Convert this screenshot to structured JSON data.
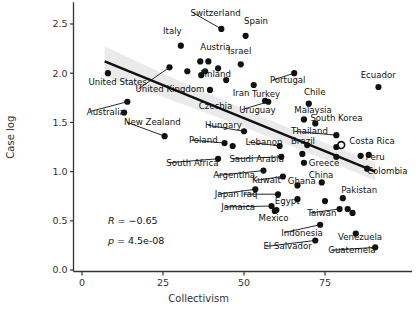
{
  "chart_data": {
    "type": "scatter",
    "title": "",
    "xlabel": "Collectivism",
    "ylabel": "Case log",
    "xlim": [
      -3,
      100
    ],
    "ylim": [
      -0.07,
      2.72
    ],
    "xticks": [
      0,
      25,
      50,
      75
    ],
    "xtick_labels": [
      "0",
      "25",
      "50",
      "75"
    ],
    "yticks": [
      0.0,
      0.5,
      1.0,
      1.5,
      2.0,
      2.5
    ],
    "ytick_labels": [
      "0.0",
      "0.5",
      "1.0",
      "1.5",
      "2.0",
      "2.5"
    ],
    "grid": false,
    "legend": null,
    "marker_color": "#111111",
    "line_color": "#111111",
    "band_color": "#d9d9d9",
    "annotations": [
      {
        "name": "correlation",
        "prefix": "R",
        "text": "R = −0.65",
        "value": -0.65,
        "x": 8,
        "y": 0.47
      },
      {
        "name": "pvalue",
        "prefix": "p",
        "text": "p = 4.5e-08",
        "value": 4.5e-08,
        "x": 8,
        "y": 0.26
      }
    ],
    "fit_line": {
      "x_start": 7.0,
      "x_end": 90.5,
      "y_start": 2.12,
      "y_end": 1.0
    },
    "points": [
      {
        "label": "United States",
        "x": 8.0,
        "y": 2.0,
        "filled": true,
        "label_x": 2.0,
        "label_y": 1.88,
        "anchor": "start"
      },
      {
        "label": "Australia",
        "x": 14.0,
        "y": 1.71,
        "filled": true,
        "label_x": 1.5,
        "label_y": 1.58,
        "anchor": "start"
      },
      {
        "label": "",
        "x": 13.0,
        "y": 1.6,
        "filled": true,
        "label_x": 0,
        "label_y": 0,
        "anchor": "start"
      },
      {
        "label": "New Zealand",
        "x": 25.5,
        "y": 1.36,
        "filled": true,
        "label_x": 13.0,
        "label_y": 1.47,
        "anchor": "start"
      },
      {
        "label": "United Kingdom",
        "x": 27.0,
        "y": 2.06,
        "filled": true,
        "label_x": 16.5,
        "label_y": 1.81,
        "anchor": "start"
      },
      {
        "label": "Italy",
        "x": 30.5,
        "y": 2.28,
        "filled": true,
        "label_x": 25.0,
        "label_y": 2.4,
        "anchor": "start"
      },
      {
        "label": "",
        "x": 32.5,
        "y": 2.02,
        "filled": true,
        "label_x": 0,
        "label_y": 0,
        "anchor": "start"
      },
      {
        "label": "Switzerland",
        "x": 43.0,
        "y": 2.45,
        "filled": true,
        "label_x": 33.5,
        "label_y": 2.58,
        "anchor": "start"
      },
      {
        "label": "Austria",
        "x": 36.5,
        "y": 2.12,
        "filled": true,
        "label_x": 36.5,
        "label_y": 2.24,
        "anchor": "start"
      },
      {
        "label": "",
        "x": 39.0,
        "y": 2.12,
        "filled": true,
        "label_x": 0,
        "label_y": 0,
        "anchor": "start"
      },
      {
        "label": "",
        "x": 38.0,
        "y": 2.02,
        "filled": true,
        "label_x": 0,
        "label_y": 0,
        "anchor": "start"
      },
      {
        "label": "Finland",
        "x": 42.0,
        "y": 2.05,
        "filled": true,
        "label_x": 36.5,
        "label_y": 1.96,
        "anchor": "start"
      },
      {
        "label": "",
        "x": 36.8,
        "y": 1.98,
        "filled": true,
        "label_x": 0,
        "label_y": 0,
        "anchor": "start"
      },
      {
        "label": "",
        "x": 44.5,
        "y": 1.93,
        "filled": true,
        "label_x": 0,
        "label_y": 0,
        "anchor": "start"
      },
      {
        "label": "Czechia",
        "x": 39.5,
        "y": 1.83,
        "filled": true,
        "label_x": 36.0,
        "label_y": 1.64,
        "anchor": "start"
      },
      {
        "label": "Spain",
        "x": 50.5,
        "y": 2.38,
        "filled": true,
        "label_x": 50.0,
        "label_y": 2.5,
        "anchor": "start"
      },
      {
        "label": "Israel",
        "x": 49.0,
        "y": 2.09,
        "filled": true,
        "label_x": 45.0,
        "label_y": 2.2,
        "anchor": "start"
      },
      {
        "label": "Iran",
        "x": 53.0,
        "y": 1.88,
        "filled": true,
        "label_x": 46.5,
        "label_y": 1.77,
        "anchor": "start"
      },
      {
        "label": "Turkey",
        "x": 56.5,
        "y": 1.72,
        "filled": true,
        "label_x": 52.5,
        "label_y": 1.76,
        "anchor": "start"
      },
      {
        "label": "Uruguay",
        "x": 57.5,
        "y": 1.71,
        "filled": true,
        "label_x": 48.5,
        "label_y": 1.6,
        "anchor": "start"
      },
      {
        "label": "Portugal",
        "x": 65.5,
        "y": 2.0,
        "filled": true,
        "label_x": 58.0,
        "label_y": 1.9,
        "anchor": "start"
      },
      {
        "label": "Ecuador",
        "x": 91.5,
        "y": 1.86,
        "filled": true,
        "label_x": 86.0,
        "label_y": 1.95,
        "anchor": "start"
      },
      {
        "label": "Chile",
        "x": 70.0,
        "y": 1.69,
        "filled": true,
        "label_x": 68.5,
        "label_y": 1.78,
        "anchor": "start"
      },
      {
        "label": "Malaysia",
        "x": 68.5,
        "y": 1.53,
        "filled": true,
        "label_x": 65.5,
        "label_y": 1.6,
        "anchor": "start"
      },
      {
        "label": "South Korea",
        "x": 72.0,
        "y": 1.49,
        "filled": true,
        "label_x": 70.5,
        "label_y": 1.51,
        "anchor": "start"
      },
      {
        "label": "Thailand",
        "x": 78.5,
        "y": 1.37,
        "filled": true,
        "label_x": 64.5,
        "label_y": 1.38,
        "anchor": "start"
      },
      {
        "label": "Costa Rica",
        "x": 80.0,
        "y": 1.27,
        "filled": false,
        "label_x": 82.5,
        "label_y": 1.28,
        "anchor": "start"
      },
      {
        "label": "",
        "x": 78.5,
        "y": 1.25,
        "filled": true,
        "label_x": 0,
        "label_y": 0,
        "anchor": "start"
      },
      {
        "label": "",
        "x": 78.5,
        "y": 1.15,
        "filled": true,
        "label_x": 0,
        "label_y": 0,
        "anchor": "start"
      },
      {
        "label": "Peru",
        "x": 86.0,
        "y": 1.16,
        "filled": true,
        "label_x": 87.5,
        "label_y": 1.12,
        "anchor": "start"
      },
      {
        "label": "",
        "x": 88.5,
        "y": 1.17,
        "filled": true,
        "label_x": 0,
        "label_y": 0,
        "anchor": "start"
      },
      {
        "label": "Colombia",
        "x": 88.0,
        "y": 1.03,
        "filled": true,
        "label_x": 88.0,
        "label_y": 0.98,
        "anchor": "start"
      },
      {
        "label": "Brazil",
        "x": 69.5,
        "y": 1.27,
        "filled": true,
        "label_x": 64.5,
        "label_y": 1.28,
        "anchor": "start"
      },
      {
        "label": "",
        "x": 68.0,
        "y": 1.18,
        "filled": true,
        "label_x": 0,
        "label_y": 0,
        "anchor": "start"
      },
      {
        "label": "Greece",
        "x": 68.5,
        "y": 1.09,
        "filled": true,
        "label_x": 70.0,
        "label_y": 1.06,
        "anchor": "start"
      },
      {
        "label": "Lebanon",
        "x": 61.0,
        "y": 1.26,
        "filled": true,
        "label_x": 50.5,
        "label_y": 1.27,
        "anchor": "start"
      },
      {
        "label": "",
        "x": 46.5,
        "y": 1.26,
        "filled": true,
        "label_x": 0,
        "label_y": 0,
        "anchor": "start"
      },
      {
        "label": "Hungary",
        "x": 50.0,
        "y": 1.41,
        "filled": true,
        "label_x": 38.0,
        "label_y": 1.44,
        "anchor": "start"
      },
      {
        "label": "Poland",
        "x": 44.0,
        "y": 1.29,
        "filled": true,
        "label_x": 33.0,
        "label_y": 1.29,
        "anchor": "start"
      },
      {
        "label": "South Africa",
        "x": 42.0,
        "y": 1.13,
        "filled": true,
        "label_x": 26.0,
        "label_y": 1.06,
        "anchor": "start"
      },
      {
        "label": "Saudi Arabia",
        "x": 61.5,
        "y": 1.15,
        "filled": true,
        "label_x": 45.5,
        "label_y": 1.1,
        "anchor": "start"
      },
      {
        "label": "Argentina",
        "x": 56.0,
        "y": 1.01,
        "filled": true,
        "label_x": 40.5,
        "label_y": 0.93,
        "anchor": "start"
      },
      {
        "label": "Kuwait",
        "x": 62.0,
        "y": 0.95,
        "filled": true,
        "label_x": 52.5,
        "label_y": 0.88,
        "anchor": "start"
      },
      {
        "label": "Ghana",
        "x": 66.5,
        "y": 0.86,
        "filled": true,
        "label_x": 63.5,
        "label_y": 0.87,
        "anchor": "start"
      },
      {
        "label": "China",
        "x": 74.0,
        "y": 0.89,
        "filled": true,
        "label_x": 70.0,
        "label_y": 0.94,
        "anchor": "start"
      },
      {
        "label": "Japan",
        "x": 53.5,
        "y": 0.82,
        "filled": true,
        "label_x": 41.0,
        "label_y": 0.74,
        "anchor": "start"
      },
      {
        "label": "Iraq",
        "x": 60.5,
        "y": 0.77,
        "filled": true,
        "label_x": 49.0,
        "label_y": 0.74,
        "anchor": "start"
      },
      {
        "label": "Egypt",
        "x": 66.5,
        "y": 0.72,
        "filled": true,
        "label_x": 59.5,
        "label_y": 0.67,
        "anchor": "start"
      },
      {
        "label": "Jamaica",
        "x": 58.5,
        "y": 0.65,
        "filled": true,
        "label_x": 43.0,
        "label_y": 0.61,
        "anchor": "start"
      },
      {
        "label": "",
        "x": 60.0,
        "y": 0.61,
        "filled": true,
        "label_x": 0,
        "label_y": 0,
        "anchor": "start"
      },
      {
        "label": "Mexico",
        "x": 59.5,
        "y": 0.6,
        "filled": true,
        "label_x": 54.5,
        "label_y": 0.5,
        "anchor": "start"
      },
      {
        "label": "Pakistan",
        "x": 80.5,
        "y": 0.73,
        "filled": true,
        "label_x": 80.0,
        "label_y": 0.78,
        "anchor": "start"
      },
      {
        "label": "",
        "x": 75.0,
        "y": 0.7,
        "filled": true,
        "label_x": 0,
        "label_y": 0,
        "anchor": "start"
      },
      {
        "label": "Taiwan",
        "x": 79.5,
        "y": 0.62,
        "filled": true,
        "label_x": 69.5,
        "label_y": 0.55,
        "anchor": "start"
      },
      {
        "label": "",
        "x": 82.0,
        "y": 0.62,
        "filled": true,
        "label_x": 0,
        "label_y": 0,
        "anchor": "start"
      },
      {
        "label": "",
        "x": 83.5,
        "y": 0.58,
        "filled": true,
        "label_x": 0,
        "label_y": 0,
        "anchor": "start"
      },
      {
        "label": "Indonesia",
        "x": 73.5,
        "y": 0.46,
        "filled": true,
        "label_x": 61.5,
        "label_y": 0.35,
        "anchor": "start"
      },
      {
        "label": "Venezuela",
        "x": 84.5,
        "y": 0.37,
        "filled": true,
        "label_x": 79.0,
        "label_y": 0.3,
        "anchor": "start"
      },
      {
        "label": "El Salvador",
        "x": 72.0,
        "y": 0.3,
        "filled": true,
        "label_x": 56.0,
        "label_y": 0.21,
        "anchor": "start"
      },
      {
        "label": "Guatemela",
        "x": 90.5,
        "y": 0.23,
        "filled": true,
        "label_x": 76.0,
        "label_y": 0.17,
        "anchor": "start"
      }
    ]
  }
}
